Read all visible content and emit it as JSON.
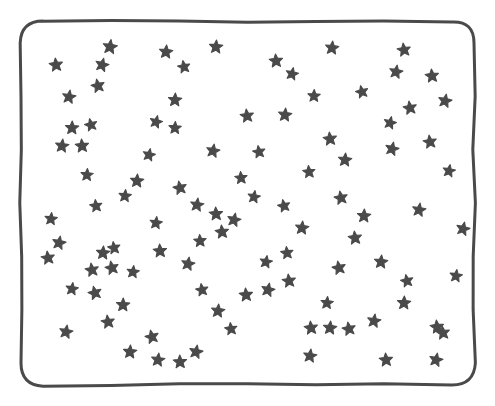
{
  "canvas": {
    "width": 495,
    "height": 406,
    "background_color": "#ffffff",
    "description": "hand-drawn rounded rectangle frame filled with scattered five-pointed stars"
  },
  "frame": {
    "name": "hand-drawn-rounded-rectangle-border",
    "stroke_color": "#4a4a4a",
    "stroke_width": 3,
    "corner_radius": 22,
    "x": 21,
    "y": 21,
    "width": 453,
    "height": 364
  },
  "stars": {
    "glyph": "star-icon",
    "fill_color": "#4a4a4a",
    "count": 100,
    "default_size": 11,
    "points": [
      {
        "x": 110,
        "y": 47,
        "r": 13,
        "a": 8
      },
      {
        "x": 56,
        "y": 65,
        "r": 12,
        "a": -6
      },
      {
        "x": 102,
        "y": 65,
        "r": 12,
        "a": 14
      },
      {
        "x": 166,
        "y": 52,
        "r": 12,
        "a": 5
      },
      {
        "x": 184,
        "y": 67,
        "r": 11,
        "a": -10
      },
      {
        "x": 216,
        "y": 47,
        "r": 12,
        "a": 4
      },
      {
        "x": 276,
        "y": 61,
        "r": 12,
        "a": -4
      },
      {
        "x": 292,
        "y": 74,
        "r": 11,
        "a": 12
      },
      {
        "x": 332,
        "y": 48,
        "r": 12,
        "a": 6
      },
      {
        "x": 404,
        "y": 50,
        "r": 12,
        "a": -8
      },
      {
        "x": 396,
        "y": 72,
        "r": 12,
        "a": 10
      },
      {
        "x": 432,
        "y": 76,
        "r": 12,
        "a": -5
      },
      {
        "x": 69,
        "y": 97,
        "r": 12,
        "a": 9
      },
      {
        "x": 98,
        "y": 86,
        "r": 12,
        "a": -12
      },
      {
        "x": 175,
        "y": 100,
        "r": 12,
        "a": 3
      },
      {
        "x": 156,
        "y": 122,
        "r": 11,
        "a": 14
      },
      {
        "x": 247,
        "y": 116,
        "r": 12,
        "a": -7
      },
      {
        "x": 285,
        "y": 115,
        "r": 12,
        "a": 6
      },
      {
        "x": 410,
        "y": 108,
        "r": 12,
        "a": -9
      },
      {
        "x": 445,
        "y": 101,
        "r": 12,
        "a": 11
      },
      {
        "x": 72,
        "y": 128,
        "r": 12,
        "a": 2
      },
      {
        "x": 91,
        "y": 125,
        "r": 11,
        "a": -13
      },
      {
        "x": 62,
        "y": 146,
        "r": 12,
        "a": 7
      },
      {
        "x": 82,
        "y": 146,
        "r": 12,
        "a": -4
      },
      {
        "x": 213,
        "y": 151,
        "r": 12,
        "a": 10
      },
      {
        "x": 330,
        "y": 139,
        "r": 12,
        "a": -6
      },
      {
        "x": 345,
        "y": 160,
        "r": 12,
        "a": 5
      },
      {
        "x": 392,
        "y": 149,
        "r": 12,
        "a": 13
      },
      {
        "x": 430,
        "y": 142,
        "r": 12,
        "a": -8
      },
      {
        "x": 137,
        "y": 181,
        "r": 12,
        "a": 4
      },
      {
        "x": 180,
        "y": 188,
        "r": 12,
        "a": -11
      },
      {
        "x": 197,
        "y": 205,
        "r": 12,
        "a": 8
      },
      {
        "x": 216,
        "y": 214,
        "r": 12,
        "a": -3
      },
      {
        "x": 234,
        "y": 220,
        "r": 12,
        "a": 12
      },
      {
        "x": 96,
        "y": 206,
        "r": 11,
        "a": -7
      },
      {
        "x": 302,
        "y": 228,
        "r": 12,
        "a": 6
      },
      {
        "x": 341,
        "y": 198,
        "r": 12,
        "a": -10
      },
      {
        "x": 364,
        "y": 216,
        "r": 12,
        "a": 3
      },
      {
        "x": 419,
        "y": 210,
        "r": 12,
        "a": 9
      },
      {
        "x": 222,
        "y": 232,
        "r": 12,
        "a": -5
      },
      {
        "x": 59,
        "y": 243,
        "r": 12,
        "a": 11
      },
      {
        "x": 48,
        "y": 258,
        "r": 12,
        "a": -8
      },
      {
        "x": 103,
        "y": 253,
        "r": 12,
        "a": 4
      },
      {
        "x": 112,
        "y": 268,
        "r": 12,
        "a": -12
      },
      {
        "x": 133,
        "y": 272,
        "r": 11,
        "a": 7
      },
      {
        "x": 160,
        "y": 251,
        "r": 12,
        "a": -3
      },
      {
        "x": 188,
        "y": 264,
        "r": 12,
        "a": 10
      },
      {
        "x": 355,
        "y": 238,
        "r": 12,
        "a": -6
      },
      {
        "x": 381,
        "y": 262,
        "r": 12,
        "a": 5
      },
      {
        "x": 463,
        "y": 229,
        "r": 12,
        "a": 13
      },
      {
        "x": 92,
        "y": 270,
        "r": 12,
        "a": -9
      },
      {
        "x": 123,
        "y": 305,
        "r": 12,
        "a": 2
      },
      {
        "x": 95,
        "y": 293,
        "r": 12,
        "a": -14
      },
      {
        "x": 72,
        "y": 289,
        "r": 11,
        "a": 8
      },
      {
        "x": 246,
        "y": 295,
        "r": 12,
        "a": -4
      },
      {
        "x": 268,
        "y": 290,
        "r": 12,
        "a": 12
      },
      {
        "x": 289,
        "y": 281,
        "r": 12,
        "a": -7
      },
      {
        "x": 218,
        "y": 311,
        "r": 12,
        "a": 6
      },
      {
        "x": 339,
        "y": 268,
        "r": 12,
        "a": -11
      },
      {
        "x": 404,
        "y": 303,
        "r": 12,
        "a": 3
      },
      {
        "x": 374,
        "y": 321,
        "r": 12,
        "a": 9
      },
      {
        "x": 437,
        "y": 327,
        "r": 12,
        "a": -5
      },
      {
        "x": 66,
        "y": 332,
        "r": 12,
        "a": 10
      },
      {
        "x": 108,
        "y": 322,
        "r": 12,
        "a": -8
      },
      {
        "x": 130,
        "y": 352,
        "r": 12,
        "a": 4
      },
      {
        "x": 152,
        "y": 337,
        "r": 12,
        "a": -13
      },
      {
        "x": 158,
        "y": 360,
        "r": 12,
        "a": 7
      },
      {
        "x": 180,
        "y": 362,
        "r": 12,
        "a": -2
      },
      {
        "x": 196,
        "y": 352,
        "r": 12,
        "a": 11
      },
      {
        "x": 311,
        "y": 328,
        "r": 12,
        "a": -6
      },
      {
        "x": 330,
        "y": 328,
        "r": 12,
        "a": 5
      },
      {
        "x": 349,
        "y": 329,
        "r": 12,
        "a": -10
      },
      {
        "x": 310,
        "y": 356,
        "r": 12,
        "a": 8
      },
      {
        "x": 386,
        "y": 360,
        "r": 12,
        "a": -4
      },
      {
        "x": 436,
        "y": 360,
        "r": 12,
        "a": 12
      },
      {
        "x": 443,
        "y": 333,
        "r": 12,
        "a": -7
      },
      {
        "x": 125,
        "y": 196,
        "r": 11,
        "a": 6
      },
      {
        "x": 259,
        "y": 152,
        "r": 11,
        "a": -9
      },
      {
        "x": 175,
        "y": 128,
        "r": 11,
        "a": 3
      },
      {
        "x": 390,
        "y": 123,
        "r": 11,
        "a": 13
      },
      {
        "x": 309,
        "y": 172,
        "r": 11,
        "a": -5
      },
      {
        "x": 254,
        "y": 197,
        "r": 11,
        "a": 9
      },
      {
        "x": 284,
        "y": 206,
        "r": 11,
        "a": -12
      },
      {
        "x": 87,
        "y": 175,
        "r": 11,
        "a": 4
      },
      {
        "x": 114,
        "y": 248,
        "r": 11,
        "a": -8
      },
      {
        "x": 156,
        "y": 223,
        "r": 11,
        "a": 7
      },
      {
        "x": 200,
        "y": 241,
        "r": 11,
        "a": -3
      },
      {
        "x": 266,
        "y": 262,
        "r": 11,
        "a": 10
      },
      {
        "x": 287,
        "y": 253,
        "r": 11,
        "a": -6
      },
      {
        "x": 327,
        "y": 303,
        "r": 11,
        "a": 5
      },
      {
        "x": 407,
        "y": 281,
        "r": 11,
        "a": -11
      },
      {
        "x": 456,
        "y": 276,
        "r": 11,
        "a": 8
      },
      {
        "x": 241,
        "y": 178,
        "r": 11,
        "a": -4
      },
      {
        "x": 149,
        "y": 155,
        "r": 11,
        "a": 12
      },
      {
        "x": 202,
        "y": 290,
        "r": 11,
        "a": -9
      },
      {
        "x": 51,
        "y": 219,
        "r": 11,
        "a": 6
      },
      {
        "x": 362,
        "y": 92,
        "r": 11,
        "a": -13
      },
      {
        "x": 314,
        "y": 96,
        "r": 11,
        "a": 2
      },
      {
        "x": 449,
        "y": 171,
        "r": 11,
        "a": 10
      },
      {
        "x": 231,
        "y": 329,
        "r": 11,
        "a": -7
      }
    ]
  }
}
